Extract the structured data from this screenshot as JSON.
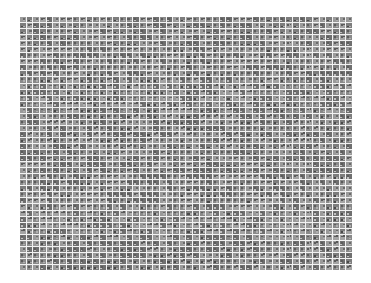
{
  "mosaic": {
    "description": "Thumbnail mosaic grid of small grayscale images",
    "columns": 50,
    "rows": 42,
    "cell_count": 2100,
    "colors": {
      "background": "#ffffff",
      "gap": "#f2f2f2",
      "cell_base": "#8a8a8a"
    }
  }
}
